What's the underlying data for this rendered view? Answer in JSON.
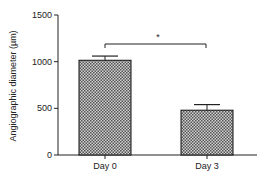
{
  "chart_data": {
    "type": "bar",
    "title": "",
    "xlabel": "",
    "ylabel": "Angiographic diameter (µm)",
    "categories": [
      "Day 0",
      "Day 3"
    ],
    "values": [
      1015,
      480
    ],
    "error_bars": [
      45,
      60
    ],
    "ylim": [
      0,
      1500
    ],
    "yticks": [
      0,
      500,
      1000,
      1500
    ],
    "ytick_labels": [
      "0",
      "500",
      "1000",
      "1500"
    ],
    "grid": false,
    "legend": null,
    "bar_fill": "checkered gray pattern",
    "annotations": [
      {
        "type": "significance-bracket",
        "from": "Day 0",
        "to": "Day 3",
        "label": "*"
      }
    ]
  },
  "colors": {
    "axis": "#222222",
    "bar_dark": "#555555",
    "bar_light": "#cfcfcf",
    "bar_border": "#111111"
  }
}
